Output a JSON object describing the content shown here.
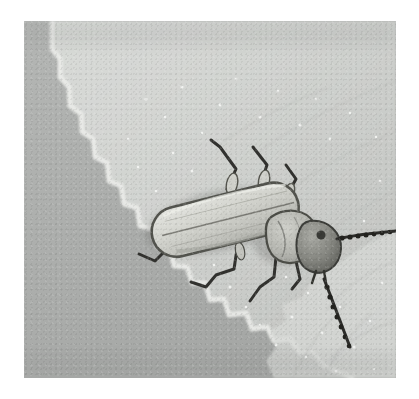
{
  "image": {
    "kind": "photograph",
    "subject": "soldier beetle on a serrated leaf edge",
    "color_mode": "grayscale",
    "alt_text": "Black and white macro photograph of a pale elongated beetle resting on the serrated edge of a leaf",
    "canvas": {
      "width": 419,
      "height": 399,
      "background": "#ffffff"
    },
    "frame": {
      "x": 24,
      "y": 21,
      "width": 372,
      "height": 357,
      "border_color": "#ffffff"
    },
    "palette": {
      "background_shadow": "#a7a9a7",
      "leaf_midtone": "#c2c4c1",
      "leaf_light": "#d6d8d5",
      "leaf_highlight": "#e8eae7",
      "leaf_edge_white": "#f1f2f0",
      "beetle_elytra_light": "#d9dad4",
      "beetle_elytra_shade": "#b6b7b1",
      "beetle_outline": "#4a4a48",
      "beetle_dark": "#3a3a38",
      "leg_dark": "#2e2e2c",
      "speckle_white": "#f6f7f5"
    },
    "regions": [
      {
        "name": "out-of-focus shadow background",
        "position": "left and lower-left"
      },
      {
        "name": "leaf blade",
        "position": "centre and right, fills most of frame"
      },
      {
        "name": "serrated leaf margin",
        "position": "diagonal from upper-left to lower-centre"
      },
      {
        "name": "leaf veins",
        "position": "radiating across right half"
      }
    ],
    "subject_parts": [
      {
        "name": "elytra",
        "description": "pale elongated wing covers with central suture line",
        "cx": 205,
        "cy": 200
      },
      {
        "name": "pronotum",
        "description": "rounded pale shield behind head",
        "cx": 270,
        "cy": 218
      },
      {
        "name": "head",
        "description": "dark rounded head with mouthparts",
        "cx": 293,
        "cy": 232
      },
      {
        "name": "antenna-right",
        "description": "long beaded antenna extending to the right",
        "cx": 340,
        "cy": 237
      },
      {
        "name": "antenna-lower",
        "description": "long beaded antenna extending down-right",
        "cx": 330,
        "cy": 280
      },
      {
        "name": "leg-front-upper",
        "description": "upper leg bent at knee",
        "cx": 223,
        "cy": 152
      },
      {
        "name": "leg-mid-upper",
        "description": "second upper leg bent at knee",
        "cx": 252,
        "cy": 160
      },
      {
        "name": "leg-front-lower",
        "description": "lower leg with zigzag tarsus",
        "cx": 183,
        "cy": 248
      },
      {
        "name": "leg-mid-lower",
        "description": "second lower leg with zigzag tarsus",
        "cx": 233,
        "cy": 262
      },
      {
        "name": "leg-hind-lower",
        "description": "hind leg near head",
        "cx": 272,
        "cy": 262
      }
    ]
  }
}
